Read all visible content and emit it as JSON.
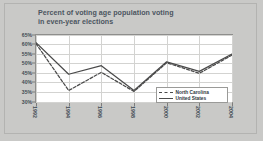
{
  "title": {
    "line1": "Percent of voting age population voting",
    "line2": "in even-year elections"
  },
  "legend": {
    "items": [
      {
        "label": "North Carolina",
        "style": "dashed",
        "color": "#4a4a4a"
      },
      {
        "label": "United States",
        "style": "solid",
        "color": "#4a4a4a"
      }
    ]
  },
  "colors": {
    "background": "#c9c9c7",
    "plot_background": "#ffffff",
    "title_text": "#4b5560",
    "axis_text": "#3f4953",
    "gridline": "#d3d3d1",
    "series": "#4a4a4a"
  },
  "chart_data": {
    "type": "line",
    "title": "Percent of voting age population voting in even-year elections",
    "xlabel": "",
    "ylabel": "",
    "x": [
      "1992",
      "1994",
      "1996",
      "1998",
      "2000",
      "2002",
      "2004"
    ],
    "categories": [
      "1992",
      "1994",
      "1996",
      "1998",
      "2000",
      "2002",
      "2004"
    ],
    "series": [
      {
        "name": "North Carolina",
        "style": "dashed",
        "values": [
          60.5,
          36.0,
          45.5,
          35.5,
          50.5,
          45.0,
          54.5
        ]
      },
      {
        "name": "United States",
        "style": "solid",
        "values": [
          61.0,
          44.5,
          49.0,
          36.0,
          51.0,
          46.0,
          55.0
        ]
      }
    ],
    "ylim": [
      30,
      65
    ],
    "yticks": [
      65,
      60,
      55,
      50,
      45,
      40,
      35,
      30
    ],
    "ytick_labels": [
      "65%",
      "60%",
      "55%",
      "50%",
      "45%",
      "40%",
      "35%",
      "30%"
    ],
    "grid": true,
    "legend_position": "inside lower-right"
  }
}
